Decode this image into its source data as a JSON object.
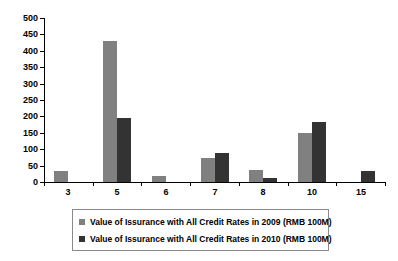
{
  "chart_data": {
    "type": "bar",
    "title": "",
    "subtitle": "",
    "xlabel": "",
    "ylabel": "",
    "categories": [
      "3",
      "5",
      "6",
      "7",
      "8",
      "10",
      "15"
    ],
    "series": [
      {
        "name": "Value of Issurance with All Credit Rates in 2009 (RMB 100M)",
        "color": "#808080",
        "values": [
          33,
          430,
          18,
          72,
          37,
          148,
          0
        ]
      },
      {
        "name": "Value of Issurance with All Credit Rates in 2010 (RMB 100M)",
        "color": "#333333",
        "values": [
          0,
          195,
          0,
          88,
          12,
          182,
          33
        ]
      }
    ],
    "ylim": [
      0,
      500
    ],
    "yticks": [
      0,
      50,
      100,
      150,
      200,
      250,
      300,
      350,
      400,
      450,
      500
    ],
    "ytick_labels": [
      "0",
      "50",
      "100",
      "150",
      "200",
      "250",
      "300",
      "350",
      "400",
      "450",
      "500"
    ],
    "grid": false,
    "legend_position": "bottom",
    "background": "#ffffff"
  },
  "legend": {
    "entries": [
      {
        "swatch": "#808080",
        "label": "Value of Issurance with All Credit Rates in 2009 (RMB 100M)"
      },
      {
        "swatch": "#333333",
        "label": "Value of Issurance with All Credit Rates in 2010 (RMB 100M)"
      }
    ]
  }
}
